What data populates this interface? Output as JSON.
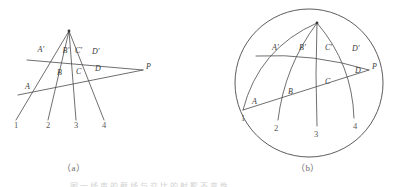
{
  "figure": {
    "panel_a": {
      "caption": "（a）",
      "apex_label": "",
      "point_labels_upper": [
        "A'",
        "B'",
        "C'",
        "D'"
      ],
      "point_labels_lower": [
        "A",
        "B",
        "C",
        "D"
      ],
      "pole_label": "P",
      "ray_numbers": [
        "1",
        "2",
        "3",
        "4"
      ],
      "apex": {
        "x": 69,
        "y": 31
      },
      "pole": {
        "x": 143,
        "y": 70
      },
      "rays": [
        {
          "number": "1",
          "end_x": 16,
          "end_y": 120
        },
        {
          "number": "2",
          "end_x": 48,
          "end_y": 120
        },
        {
          "number": "3",
          "end_x": 76,
          "end_y": 120
        },
        {
          "number": "4",
          "end_x": 104,
          "end_y": 120
        }
      ],
      "transversal_upper": {
        "x1": 27,
        "y1": 60,
        "x2": 143,
        "y2": 70
      },
      "transversal_lower": {
        "x1": 18,
        "y1": 95,
        "x2": 143,
        "y2": 70
      },
      "upper_points": [
        {
          "label": "A'",
          "x": 37.5,
          "y": 51.5
        },
        {
          "label": "B'",
          "x": 62.5,
          "y": 52.5
        },
        {
          "label": "C'",
          "x": 75.0,
          "y": 52.5
        },
        {
          "label": "D'",
          "x": 92.0,
          "y": 53.5
        }
      ],
      "lower_points": [
        {
          "label": "A",
          "x": 25.0,
          "y": 89.0
        },
        {
          "label": "B",
          "x": 57.0,
          "y": 75.0
        },
        {
          "label": "C",
          "x": 76.0,
          "y": 74.0
        },
        {
          "label": "D",
          "x": 95.0,
          "y": 71.0
        }
      ],
      "number_positions": [
        {
          "label": "1",
          "x": 14,
          "y": 128
        },
        {
          "label": "2",
          "x": 46,
          "y": 128
        },
        {
          "label": "3",
          "x": 74,
          "y": 128
        },
        {
          "label": "4",
          "x": 102,
          "y": 128
        }
      ]
    },
    "panel_b": {
      "caption": "（b）",
      "circle": {
        "cx": 309,
        "cy": 83,
        "r": 74
      },
      "apex": {
        "x": 317,
        "y": 23
      },
      "pole": {
        "x": 369,
        "y": 70
      },
      "point_labels_upper": [
        "A'",
        "B'",
        "C'",
        "D'"
      ],
      "point_labels_lower": [
        "A",
        "B",
        "C",
        "D"
      ],
      "pole_label": "P",
      "ray_numbers": [
        "1",
        "2",
        "3",
        "4"
      ],
      "arcs": [
        {
          "number": "1",
          "end_x": 243,
          "end_y": 110,
          "bow": 14
        },
        {
          "number": "2",
          "end_x": 278,
          "end_y": 120,
          "bow": 7
        },
        {
          "number": "3",
          "end_x": 317,
          "end_y": 126,
          "bow": 1
        },
        {
          "number": "4",
          "end_x": 354,
          "end_y": 118,
          "bow": -9
        }
      ],
      "chord_upper": {
        "x1": 256,
        "y1": 56,
        "x2": 369,
        "y2": 70,
        "bow": -5
      },
      "chord_lower": {
        "x1": 243,
        "y1": 110,
        "x2": 369,
        "y2": 70,
        "bow": 0
      },
      "upper_points": [
        {
          "label": "A'",
          "x": 272,
          "y": 50
        },
        {
          "label": "B'",
          "x": 299,
          "y": 50
        },
        {
          "label": "C'",
          "x": 325,
          "y": 50
        },
        {
          "label": "D'",
          "x": 352,
          "y": 51
        }
      ],
      "lower_points": [
        {
          "label": "A",
          "x": 252,
          "y": 104
        },
        {
          "label": "B",
          "x": 288,
          "y": 94
        },
        {
          "label": "C",
          "x": 325,
          "y": 84
        },
        {
          "label": "D",
          "x": 355,
          "y": 73
        }
      ],
      "number_positions": [
        {
          "label": "1",
          "x": 241,
          "y": 121
        },
        {
          "label": "2",
          "x": 274,
          "y": 131
        },
        {
          "label": "3",
          "x": 314,
          "y": 137
        },
        {
          "label": "4",
          "x": 353,
          "y": 129
        }
      ]
    },
    "footer_text": "图 一 线 束 的 截 线 与 交 比 的 射 影 不 变 性"
  },
  "colors": {
    "ink": "#4a4a4a",
    "label_ink": "#3a3a3a",
    "caption_ink": "#6b6b6b",
    "background": "#ffffff"
  }
}
